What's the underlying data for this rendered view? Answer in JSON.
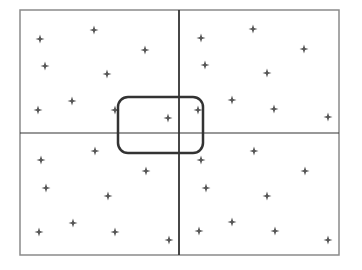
{
  "diagram": {
    "frame": {
      "x": 20,
      "y": 10,
      "width": 319,
      "height": 245,
      "stroke": "#8a8a8a"
    },
    "dividers": {
      "vertical_x": 179,
      "horizontal_y": 133,
      "stroke": "#333333"
    },
    "selection_box": {
      "x": 118,
      "y": 97,
      "width": 85,
      "height": 56,
      "radius": 10,
      "stroke": "#333333"
    },
    "marker_color": "#555555",
    "quadrants": [
      {
        "name": "top-left",
        "points": [
          [
            40,
            39
          ],
          [
            94,
            30
          ],
          [
            145,
            50
          ],
          [
            45,
            66
          ],
          [
            107,
            74
          ],
          [
            38,
            110
          ],
          [
            72,
            101
          ],
          [
            115,
            110
          ],
          [
            168,
            118
          ]
        ]
      },
      {
        "name": "top-right",
        "points": [
          [
            201,
            38
          ],
          [
            253,
            29
          ],
          [
            304,
            49
          ],
          [
            205,
            65
          ],
          [
            267,
            73
          ],
          [
            198,
            110
          ],
          [
            232,
            100
          ],
          [
            274,
            109
          ],
          [
            328,
            117
          ]
        ]
      },
      {
        "name": "bottom-left",
        "points": [
          [
            41,
            160
          ],
          [
            95,
            151
          ],
          [
            146,
            171
          ],
          [
            46,
            188
          ],
          [
            108,
            196
          ],
          [
            39,
            232
          ],
          [
            73,
            223
          ],
          [
            115,
            232
          ],
          [
            169,
            240
          ]
        ]
      },
      {
        "name": "bottom-right",
        "points": [
          [
            201,
            160
          ],
          [
            254,
            151
          ],
          [
            305,
            171
          ],
          [
            206,
            188
          ],
          [
            267,
            196
          ],
          [
            199,
            231
          ],
          [
            232,
            222
          ],
          [
            275,
            231
          ],
          [
            328,
            240
          ]
        ]
      }
    ]
  }
}
